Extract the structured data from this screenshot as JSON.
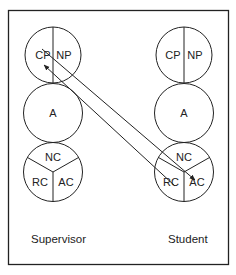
{
  "diagram": {
    "supervisor": {
      "caption": "Supervisor",
      "parent": {
        "left": "CP",
        "right": "NP"
      },
      "adult": {
        "label": "A"
      },
      "child": {
        "top": "NC",
        "left": "RC",
        "right": "AC"
      }
    },
    "student": {
      "caption": "Student",
      "parent": {
        "left": "CP",
        "right": "NP"
      },
      "adult": {
        "label": "A"
      },
      "child": {
        "top": "NC",
        "left": "RC",
        "right": "AC"
      }
    },
    "transactions": [
      {
        "from": "Supervisor CP",
        "to": "Student AC"
      },
      {
        "from": "Student AC",
        "to": "Supervisor CP"
      }
    ],
    "colors": {
      "line": "#222222",
      "background": "#ffffff"
    }
  }
}
